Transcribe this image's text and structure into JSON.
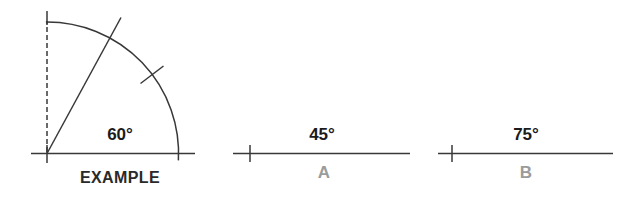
{
  "figure": {
    "example": {
      "angle": "60°",
      "caption": "EXAMPLE"
    },
    "exercises": [
      {
        "angle": "45°",
        "caption": "A"
      },
      {
        "angle": "75°",
        "caption": "B"
      }
    ]
  },
  "colors": {
    "background": "#ffffff",
    "stroke": "#383838",
    "angle_text": "#1b1b1b",
    "caption_text": "#2a2a2a",
    "caption_muted": "#9b9b9b"
  }
}
